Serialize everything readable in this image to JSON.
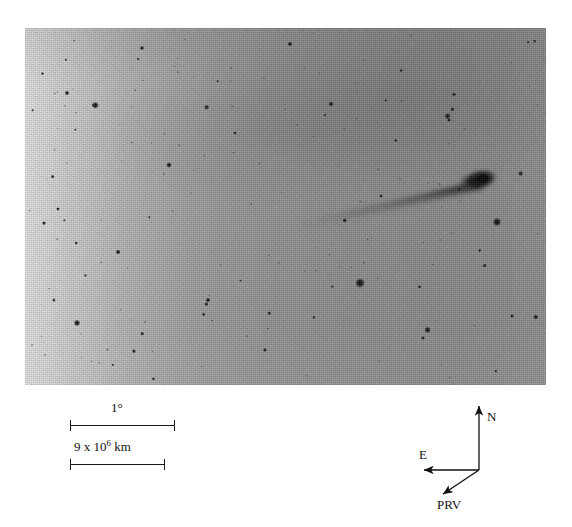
{
  "figure": {
    "type": "astronomical-photograph",
    "plate": {
      "x": 25,
      "y": 28,
      "width": 521,
      "height": 357,
      "polarity": "negative",
      "background_light_hex": "#e3e3e3",
      "background_dark_hex": "#8b8b8b",
      "star_hex": "#1d1d1d",
      "border_hex": "#8a8a8a"
    }
  },
  "scale_bars": [
    {
      "name": "angular-scale",
      "label": "1",
      "unit": "°",
      "label_full": "1°",
      "bar_x": 70,
      "bar_y": 425,
      "bar_length": 105,
      "label_x": 111,
      "label_y": 401
    },
    {
      "name": "linear-scale",
      "label_mantissa": "9 x 10",
      "label_exponent": "6",
      "label_unit": "km",
      "label_full": "9 x 10⁶ km",
      "bar_x": 70,
      "bar_y": 464,
      "bar_length": 95,
      "label_x": 74,
      "label_y": 440
    }
  ],
  "compass": {
    "vertex_x": 74,
    "vertex_y": 74,
    "arrows": [
      {
        "name": "north",
        "label": "N",
        "to_x": 74,
        "to_y": 10,
        "label_x": 82,
        "label_y": 14
      },
      {
        "name": "east",
        "label": "E",
        "to_x": 19,
        "to_y": 74,
        "label_x": 14,
        "label_y": 52
      },
      {
        "name": "prv",
        "label": "PRV",
        "to_x": 38,
        "to_y": 98,
        "label_x": 32,
        "label_y": 102
      }
    ],
    "stroke_hex": "#111111"
  },
  "chart_data": {
    "type": "scatter",
    "title": "",
    "xlabel": "",
    "ylabel": "",
    "coordinate_frame": "negative sky image; dark marks = bright objects",
    "comet": {
      "name": "comet",
      "nucleus_x": 478,
      "nucleus_y": 180,
      "coma_rx": 19,
      "coma_ry": 9,
      "coma_rotation_deg": -12,
      "tail_tip_x": 292,
      "tail_tip_y": 224,
      "tail_position_angle_deg": 193,
      "tail_length_px": 191
    },
    "bright_stars": [
      {
        "x": 360,
        "y": 283,
        "r": 5.2
      },
      {
        "x": 497,
        "y": 222,
        "r": 4.6
      },
      {
        "x": 77,
        "y": 323,
        "r": 3.4
      },
      {
        "x": 169,
        "y": 165,
        "r": 2.9
      },
      {
        "x": 331,
        "y": 104,
        "r": 2.7
      },
      {
        "x": 118,
        "y": 252,
        "r": 2.6
      },
      {
        "x": 208,
        "y": 300,
        "r": 2.5
      },
      {
        "x": 67,
        "y": 93,
        "r": 2.4
      },
      {
        "x": 290,
        "y": 44,
        "r": 2.6
      },
      {
        "x": 142,
        "y": 48,
        "r": 2.2
      },
      {
        "x": 265,
        "y": 350,
        "r": 2.1
      },
      {
        "x": 423,
        "y": 338,
        "r": 2.0
      },
      {
        "x": 449,
        "y": 120,
        "r": 2.0
      },
      {
        "x": 381,
        "y": 196,
        "r": 1.9
      },
      {
        "x": 512,
        "y": 316,
        "r": 2.0
      },
      {
        "x": 58,
        "y": 209,
        "r": 1.9
      },
      {
        "x": 235,
        "y": 133,
        "r": 1.8
      }
    ],
    "star_count_visible": 168
  }
}
